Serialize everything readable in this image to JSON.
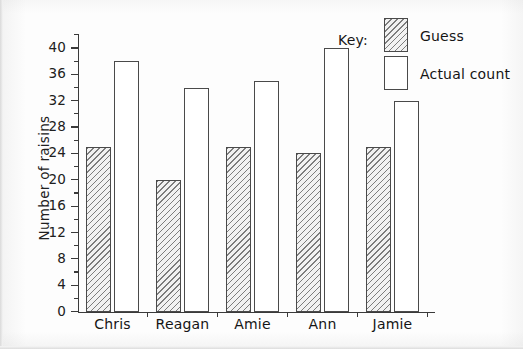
{
  "chart_data": {
    "type": "bar",
    "title": "",
    "xlabel": "",
    "ylabel": "Number of raisins",
    "ylim": [
      0,
      40
    ],
    "ytick_step": 4,
    "yminor_step": 2,
    "grid": false,
    "legend_position": "top-right",
    "legend_title": "Key:",
    "categories": [
      "Chris",
      "Reagan",
      "Amie",
      "Ann",
      "Jamie"
    ],
    "yticks": [
      "0",
      "4",
      "8",
      "12",
      "16",
      "20",
      "24",
      "28",
      "32",
      "36",
      "40"
    ],
    "series": [
      {
        "name": "Guess",
        "values": [
          25,
          20,
          25,
          24,
          25
        ],
        "fill": "hatched",
        "color": "#7d7d7d"
      },
      {
        "name": "Actual count",
        "values": [
          38,
          34,
          35,
          40,
          32
        ],
        "fill": "white",
        "color": "#ffffff"
      }
    ]
  },
  "axis": {
    "y_title": "Number of raisins"
  },
  "legend": {
    "title": "Key:",
    "entries": [
      {
        "label": "Guess"
      },
      {
        "label": "Actual count"
      }
    ]
  },
  "style": {
    "line_color": "#4a4a4a",
    "text_color": "#151515",
    "paper": "#fdfdfd"
  }
}
